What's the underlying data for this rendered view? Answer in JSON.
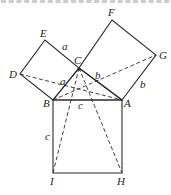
{
  "diagram": {
    "vertices": {
      "A": [
        122,
        100
      ],
      "B": [
        53,
        100
      ],
      "C": [
        79,
        68
      ],
      "D": [
        20,
        74
      ],
      "E": [
        45,
        40
      ],
      "F": [
        112,
        20
      ],
      "G": [
        156,
        55
      ],
      "H": [
        122,
        173
      ],
      "I": [
        53,
        173
      ]
    },
    "labels": {
      "A": "A",
      "B": "B",
      "C": "C",
      "D": "D",
      "E": "E",
      "F": "F",
      "G": "G",
      "H": "H",
      "I": "I"
    },
    "side_labels": {
      "a_top": "a",
      "a_mid": "a",
      "b_mid": "b",
      "b_right": "b",
      "c_top": "c",
      "c_left": "c"
    },
    "squares": [
      {
        "name": "square-BCED",
        "points": [
          "B",
          "C",
          "E",
          "D"
        ],
        "side": "a"
      },
      {
        "name": "square-CAGF",
        "points": [
          "C",
          "A",
          "G",
          "F"
        ],
        "side": "b"
      },
      {
        "name": "square-BAHI",
        "points": [
          "B",
          "A",
          "H",
          "I"
        ],
        "side": "c"
      }
    ],
    "dashed_segments": [
      [
        "D",
        "A"
      ],
      [
        "B",
        "G"
      ],
      [
        "C",
        "I"
      ],
      [
        "C",
        "H"
      ]
    ],
    "line_color": "#2a2a2a"
  }
}
